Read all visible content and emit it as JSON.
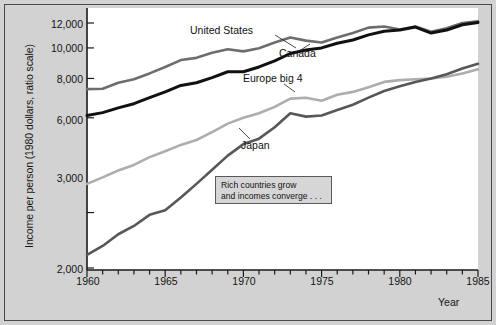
{
  "figure": {
    "background_color": "#d2d2d2",
    "plot_background_color": "#ffffff",
    "border_color": "#4a4a4a"
  },
  "axis": {
    "y_title": "Income per person (1980 dollars, ratio scale)",
    "x_title": "Year",
    "y_ticks": [
      "12,000",
      "10,000",
      "8,000",
      "6,000",
      "3,000",
      "2,000"
    ],
    "x_ticks": [
      "1960",
      "1965",
      "1970",
      "1975",
      "1980",
      "1985"
    ]
  },
  "annotations": {
    "united_states": "United States",
    "canada": "Canada",
    "europe_big_4": "Europe big 4",
    "japan": "Japan",
    "callout_line_1": "Rich countries grow",
    "callout_line_2": "and incomes converge . . ."
  },
  "chart_data": {
    "type": "line",
    "title": "",
    "subtitle": "",
    "xlabel": "Year",
    "ylabel": "Income per person (1980 dollars, ratio scale)",
    "y_scale": "log",
    "y_scale_note": "ratio scale",
    "xlim": [
      1960,
      1985
    ],
    "ylim": [
      2000,
      13000
    ],
    "y_tick_values": [
      2000,
      3000,
      6000,
      8000,
      10000,
      12000
    ],
    "x_tick_values": [
      1960,
      1965,
      1970,
      1975,
      1980,
      1985
    ],
    "grid": false,
    "legend": "inline-annotations",
    "x": [
      1960,
      1961,
      1962,
      1963,
      1964,
      1965,
      1966,
      1967,
      1968,
      1969,
      1970,
      1971,
      1972,
      1973,
      1974,
      1975,
      1976,
      1977,
      1978,
      1979,
      1980,
      1981,
      1982,
      1983,
      1984,
      1985
    ],
    "series": [
      {
        "name": "United States",
        "color": "#6d6d6d",
        "values": [
          7400,
          7420,
          7750,
          7950,
          8300,
          8700,
          9150,
          9300,
          9650,
          9900,
          9750,
          9980,
          10400,
          10800,
          10550,
          10400,
          10800,
          11150,
          11600,
          11700,
          11450,
          11700,
          11250,
          11550,
          12000,
          12150
        ]
      },
      {
        "name": "Canada",
        "color": "#111111",
        "values": [
          6100,
          6230,
          6450,
          6650,
          6950,
          7250,
          7600,
          7750,
          8050,
          8400,
          8400,
          8700,
          9100,
          9600,
          9850,
          10000,
          10350,
          10600,
          11000,
          11300,
          11400,
          11650,
          11150,
          11400,
          11850,
          12050
        ]
      },
      {
        "name": "Europe big 4",
        "color": "#adadad",
        "values": [
          3700,
          3880,
          4080,
          4250,
          4500,
          4700,
          4920,
          5100,
          5400,
          5750,
          6000,
          6200,
          6500,
          6900,
          6950,
          6800,
          7100,
          7250,
          7500,
          7800,
          7900,
          7950,
          8000,
          8100,
          8300,
          8550
        ]
      },
      {
        "name": "Japan",
        "color": "#575757",
        "values": [
          2200,
          2350,
          2560,
          2720,
          2950,
          3050,
          3350,
          3700,
          4100,
          4550,
          4950,
          5150,
          5600,
          6200,
          6050,
          6100,
          6350,
          6600,
          6950,
          7300,
          7550,
          7800,
          8000,
          8250,
          8600,
          8900
        ]
      }
    ],
    "annotations": [
      {
        "text": "United States",
        "x": 1969,
        "y": 11000
      },
      {
        "text": "Canada",
        "x": 1974,
        "y": 9400
      },
      {
        "text": "Europe big 4",
        "x": 1972,
        "y": 8100
      },
      {
        "text": "Japan",
        "x": 1972,
        "y": 4800
      },
      {
        "text": "Rich countries grow and incomes converge . . .",
        "x": 1970,
        "y": 3400
      }
    ]
  }
}
